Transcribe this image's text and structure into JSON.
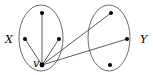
{
  "diagram": {
    "type": "bipartite-graph",
    "sets": [
      {
        "id": "X",
        "label": "X",
        "ellipse": {
          "cx": 41,
          "cy": 38,
          "rx": 22,
          "ry": 33
        },
        "label_pos": {
          "x": 5,
          "y": 43
        }
      },
      {
        "id": "Y",
        "label": "Y",
        "ellipse": {
          "cx": 109,
          "cy": 38,
          "rx": 21,
          "ry": 33
        },
        "label_pos": {
          "x": 140,
          "y": 43
        }
      }
    ],
    "nodes": [
      {
        "id": "x1",
        "set": "X",
        "x": 42,
        "y": 13
      },
      {
        "id": "x2",
        "set": "X",
        "x": 25,
        "y": 39
      },
      {
        "id": "x3",
        "set": "X",
        "x": 59,
        "y": 39
      },
      {
        "id": "v",
        "set": "X",
        "x": 42,
        "y": 65,
        "label": "v"
      },
      {
        "id": "y1",
        "set": "Y",
        "x": 111,
        "y": 13
      },
      {
        "id": "y2",
        "set": "Y",
        "x": 127,
        "y": 39
      },
      {
        "id": "y3",
        "set": "Y",
        "x": 110,
        "y": 65
      }
    ],
    "edges": [
      [
        "v",
        "x1"
      ],
      [
        "v",
        "x2"
      ],
      [
        "v",
        "x3"
      ],
      [
        "v",
        "y1"
      ],
      [
        "v",
        "y2"
      ]
    ],
    "v_label": {
      "text": "v",
      "x": 33,
      "y": 67
    }
  }
}
